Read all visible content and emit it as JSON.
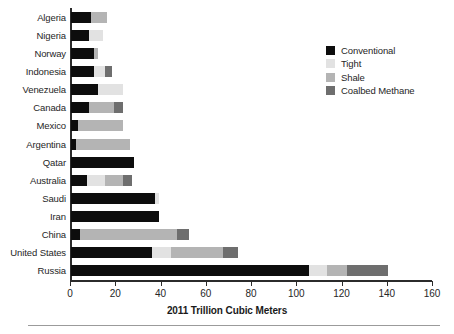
{
  "chart_data": {
    "type": "bar",
    "orientation": "horizontal",
    "stacked": true,
    "title": "",
    "xlabel": "2011 Trillion Cubic Meters",
    "ylabel": "",
    "xlim": [
      0,
      160
    ],
    "xticks": [
      0,
      20,
      40,
      60,
      80,
      100,
      120,
      140,
      160
    ],
    "grid": false,
    "legend_position": "top-right",
    "categories": [
      "Algeria",
      "Nigeria",
      "Norway",
      "Indonesia",
      "Venezuela",
      "Canada",
      "Mexico",
      "Argentina",
      "Qatar",
      "Australia",
      "Saudi",
      "Iran",
      "China",
      "United States",
      "Russia"
    ],
    "series": [
      {
        "name": "Conventional",
        "color": "#0d0d0d",
        "values": [
          9,
          8,
          10,
          10,
          12,
          8,
          3,
          2,
          28,
          7,
          37,
          39,
          4,
          36,
          105
        ]
      },
      {
        "name": "Tight",
        "color": "#e2e2e2",
        "values": [
          0,
          6,
          0,
          5,
          11,
          0,
          0,
          0,
          0,
          8,
          2,
          0,
          0,
          8,
          8
        ]
      },
      {
        "name": "Shale",
        "color": "#b4b4b4",
        "values": [
          7,
          0,
          2,
          0,
          0,
          11,
          20,
          24,
          0,
          8,
          0,
          0,
          43,
          23,
          9
        ]
      },
      {
        "name": "Coalbed Methane",
        "color": "#6e6e6e",
        "values": [
          0,
          0,
          0,
          3,
          0,
          4,
          0,
          0,
          0,
          4,
          0,
          0,
          5,
          7,
          18
        ]
      }
    ],
    "totals": [
      16,
      14,
      12,
      18,
      23,
      23,
      23,
      26,
      28,
      27,
      39,
      39,
      52,
      74,
      140
    ]
  },
  "legend": {
    "items": [
      {
        "label": "Conventional",
        "swatch": "legend-swatch-conventional"
      },
      {
        "label": "Tight",
        "swatch": "legend-swatch-tight"
      },
      {
        "label": "Shale",
        "swatch": "legend-swatch-shale"
      },
      {
        "label": "Coalbed Methane",
        "swatch": "legend-swatch-coalbed"
      }
    ]
  }
}
